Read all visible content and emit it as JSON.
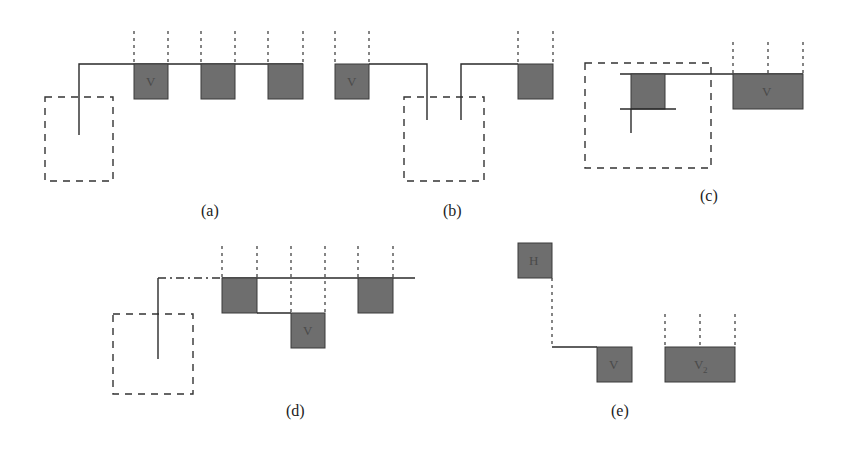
{
  "figure": {
    "panels": [
      {
        "id": "a",
        "caption": "(a)",
        "box_labels": [
          "V",
          "",
          ""
        ]
      },
      {
        "id": "b",
        "caption": "(b)",
        "box_labels": [
          "V",
          ""
        ]
      },
      {
        "id": "c",
        "caption": "(c)",
        "box_labels": [
          "",
          "V"
        ]
      },
      {
        "id": "d",
        "caption": "(d)",
        "box_labels": [
          "",
          "V",
          ""
        ]
      },
      {
        "id": "e",
        "caption": "(e)",
        "box_labels": [
          "H",
          "V",
          "V",
          "2"
        ]
      }
    ],
    "colors": {
      "box_fill": "#6e6e6e",
      "line": "#2a2a2a",
      "background": "#ffffff"
    }
  }
}
